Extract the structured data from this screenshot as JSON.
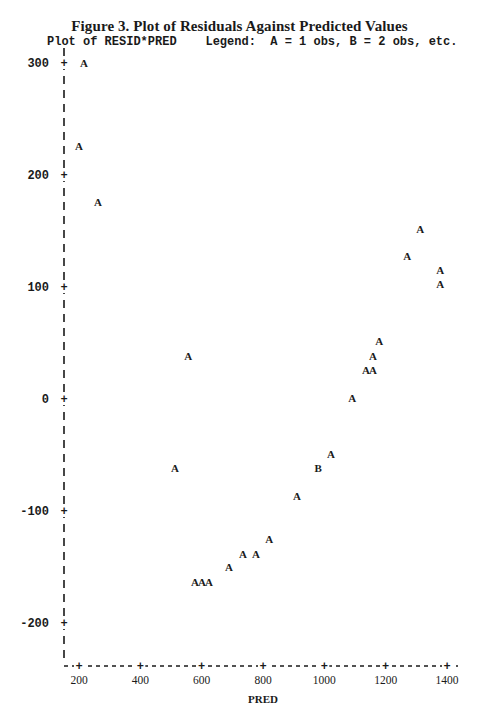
{
  "figure": {
    "title": "Figure 3.  Plot of Residuals Against Predicted Values",
    "subtitle": "Plot of RESID*PRED    Legend:  A = 1 obs, B = 2 obs, etc."
  },
  "chart_data": {
    "type": "scatter",
    "title": "Figure 3. Plot of Residuals Against Predicted Values",
    "subtitle": "Plot of RESID*PRED",
    "legend": "A = 1 obs, B = 2 obs, etc.",
    "xlabel": "PRED",
    "ylabel": "RESID",
    "xlim": [
      150,
      1420
    ],
    "ylim": [
      -240,
      310
    ],
    "x_ticks": [
      200,
      400,
      600,
      800,
      1000,
      1200,
      1400
    ],
    "y_ticks": [
      300,
      200,
      100,
      0,
      -100,
      -200
    ],
    "grid": false,
    "points": [
      {
        "x": 216,
        "y": 300,
        "symbol": "A",
        "count": 1
      },
      {
        "x": 200,
        "y": 226,
        "symbol": "A",
        "count": 1
      },
      {
        "x": 262,
        "y": 176,
        "symbol": "A",
        "count": 1
      },
      {
        "x": 556,
        "y": 38,
        "symbol": "A",
        "count": 1
      },
      {
        "x": 513,
        "y": -62,
        "symbol": "A",
        "count": 1
      },
      {
        "x": 578,
        "y": -163,
        "symbol": "A",
        "count": 1
      },
      {
        "x": 601,
        "y": -163,
        "symbol": "A",
        "count": 1
      },
      {
        "x": 624,
        "y": -163,
        "symbol": "A",
        "count": 1
      },
      {
        "x": 689,
        "y": -150,
        "symbol": "A",
        "count": 1
      },
      {
        "x": 735,
        "y": -138,
        "symbol": "A",
        "count": 1
      },
      {
        "x": 777,
        "y": -138,
        "symbol": "A",
        "count": 1
      },
      {
        "x": 820,
        "y": -125,
        "symbol": "A",
        "count": 1
      },
      {
        "x": 911,
        "y": -87,
        "symbol": "A",
        "count": 1
      },
      {
        "x": 980,
        "y": -62,
        "symbol": "B",
        "count": 2
      },
      {
        "x": 1022,
        "y": -49,
        "symbol": "A",
        "count": 1
      },
      {
        "x": 1091,
        "y": 1,
        "symbol": "A",
        "count": 1
      },
      {
        "x": 1136,
        "y": 26,
        "symbol": "A",
        "count": 1
      },
      {
        "x": 1159,
        "y": 26,
        "symbol": "A",
        "count": 1
      },
      {
        "x": 1159,
        "y": 38,
        "symbol": "A",
        "count": 1
      },
      {
        "x": 1179,
        "y": 52,
        "symbol": "A",
        "count": 1
      },
      {
        "x": 1270,
        "y": 128,
        "symbol": "A",
        "count": 1
      },
      {
        "x": 1313,
        "y": 152,
        "symbol": "A",
        "count": 1
      },
      {
        "x": 1378,
        "y": 115,
        "symbol": "A",
        "count": 1
      },
      {
        "x": 1378,
        "y": 103,
        "symbol": "A",
        "count": 1
      }
    ]
  }
}
